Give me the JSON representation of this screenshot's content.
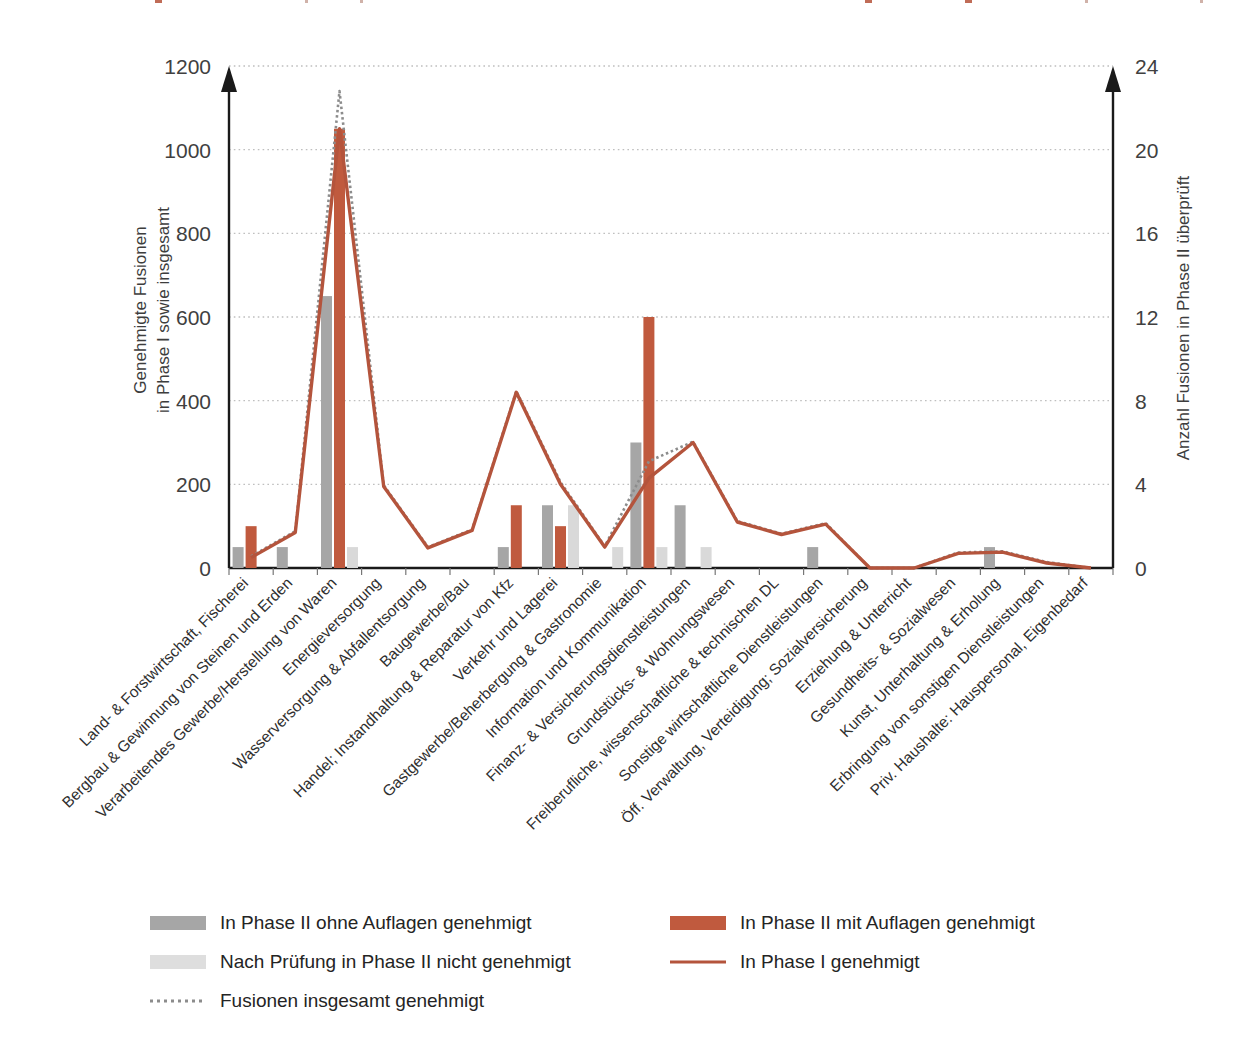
{
  "chart_data": {
    "type": "bar",
    "title": "",
    "xlabel": "",
    "ylabel": "Genehmigte Fusionen in Phase I sowie insgesamt",
    "y2label": "Anzahl Fusionen in Phase II überprüft",
    "ylim": [
      0,
      1200
    ],
    "y2lim": [
      0,
      24
    ],
    "yticks": [
      "0",
      "200",
      "400",
      "600",
      "800",
      "1000",
      "1200"
    ],
    "ytick_values": [
      0,
      200,
      400,
      600,
      800,
      1000,
      1200
    ],
    "y2ticks": [
      "0",
      "4",
      "8",
      "12",
      "16",
      "20",
      "24"
    ],
    "y2tick_values": [
      0,
      4,
      8,
      12,
      16,
      20,
      24
    ],
    "grid": true,
    "legend_position": "bottom",
    "categories": [
      "Land- & Forstwirtschaft, Fischerei",
      "Bergbau & Gewinnung von Steinen und Erden",
      "Verarbeitendes Gewerbe/Herstellung von Waren",
      "Energieversorgung",
      "Wasserversorgung & Abfallentsorgung",
      "Baugewerbe/Bau",
      "Handel; Instandhaltung & Reparatur von Kfz",
      "Verkehr und Lagerei",
      "Gastgewerbe/Beherbergung & Gastronomie",
      "Information und Kommunikation",
      "Finanz- & Versicherungsdienstleistungen",
      "Grundstücks- & Wohnungswesen",
      "Freiberufliche, wissenschaftliche & technischen DL",
      "Sonstige wirtschaftliche Dienstleistungen",
      "Öff. Verwaltung, Verteidigung; Sozialversicherung",
      "Erziehung & Unterricht",
      "Gesundheits- & Sozialwesen",
      "Kunst, Unterhaltung & Erholung",
      "Erbringung von sonstigen Dienstleistungen",
      "Priv. Haushalte: Hauspersonal, Eigenbedarf"
    ],
    "series": [
      {
        "name": "In Phase II ohne Auflagen genehmigt",
        "kind": "bar",
        "axis": "right",
        "color": "#A6A6A6",
        "values": [
          1,
          1,
          13,
          0,
          0,
          0,
          1,
          3,
          0,
          6,
          3,
          0,
          0,
          1,
          0,
          0,
          0,
          1,
          0,
          0
        ]
      },
      {
        "name": "In Phase II mit Auflagen genehmigt",
        "kind": "bar",
        "axis": "right",
        "color": "#C05A3E",
        "values": [
          2,
          0,
          21,
          0,
          0,
          0,
          3,
          2,
          0,
          12,
          0,
          0,
          0,
          0,
          0,
          0,
          0,
          0,
          0,
          0
        ]
      },
      {
        "name": "Nach Prüfung in Phase II nicht genehmigt",
        "kind": "bar",
        "axis": "right",
        "color": "#D9D9D9",
        "values": [
          0,
          0,
          1,
          0,
          0,
          0,
          0,
          3,
          1,
          1,
          1,
          0,
          0,
          0,
          0,
          0,
          0,
          0,
          0,
          0
        ]
      },
      {
        "name": "In Phase I genehmigt",
        "kind": "line",
        "axis": "left",
        "color": "#B4543C",
        "values": [
          25,
          85,
          1050,
          195,
          48,
          90,
          420,
          200,
          50,
          215,
          300,
          110,
          80,
          105,
          0,
          0,
          35,
          38,
          12,
          0
        ]
      },
      {
        "name": "Fusionen insgesamt genehmigt",
        "kind": "line-dotted",
        "axis": "left",
        "color": "#808080",
        "values": [
          28,
          88,
          1140,
          198,
          50,
          92,
          423,
          205,
          52,
          255,
          302,
          112,
          82,
          107,
          0,
          0,
          37,
          40,
          14,
          0
        ]
      }
    ]
  },
  "axes": {
    "left_title": "Genehmigte Fusionen\nin Phase I sowie insgesamt",
    "left_title_line1": "Genehmigte Fusionen",
    "left_title_line2": "in Phase I sowie insgesamt",
    "right_title": "Anzahl Fusionen in Phase II überprüft"
  },
  "legend": {
    "items": [
      {
        "label": "In Phase II ohne Auflagen genehmigt",
        "marker": "bar-swatch",
        "color": "#A6A6A6"
      },
      {
        "label": "In Phase II mit Auflagen genehmigt",
        "marker": "bar-swatch",
        "color": "#C05A3E"
      },
      {
        "label": "Nach Prüfung in Phase II nicht genehmigt",
        "marker": "bar-swatch",
        "color": "#DEDEDE"
      },
      {
        "label": "In Phase I genehmigt",
        "marker": "line-swatch",
        "color": "#B4543C"
      },
      {
        "label": "Fusionen insgesamt genehmigt",
        "marker": "dotted-line-swatch",
        "color": "#808080"
      }
    ]
  },
  "colors": {
    "bar_dark_gray": "#A6A6A6",
    "bar_light_gray": "#DEDEDE",
    "bar_orange": "#C05A3E",
    "line_orange": "#B4543C",
    "line_dotted_gray": "#8C8C8C",
    "axis": "#1a1a1a",
    "grid": "#BFBFBF",
    "text": "#3a3a3a"
  }
}
